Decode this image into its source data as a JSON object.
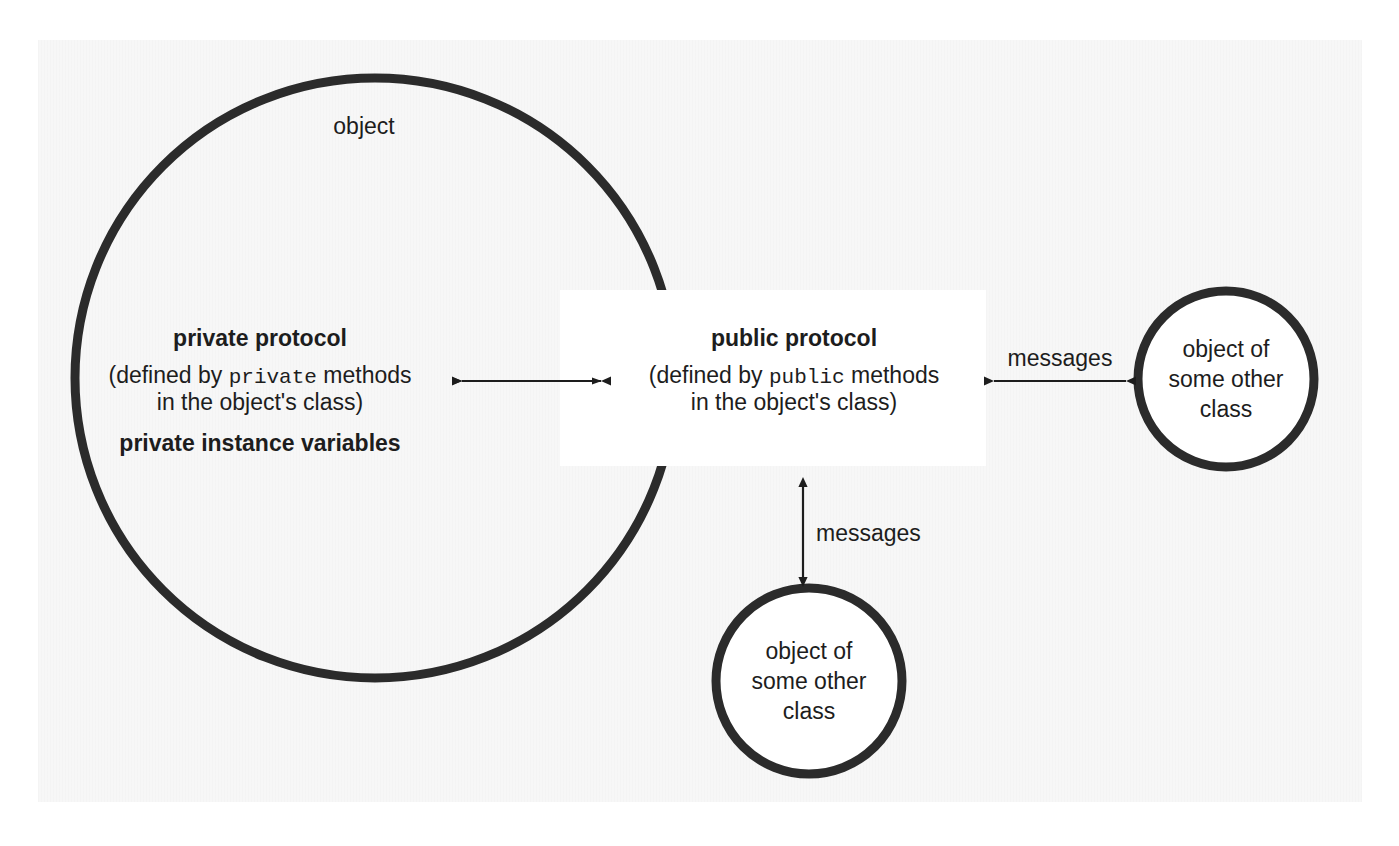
{
  "diagram": {
    "title_label": "object",
    "big_object": {
      "label": "object",
      "private": {
        "heading": "private protocol",
        "line1_prefix": "(defined by ",
        "line1_mono": "private",
        "line1_suffix": " methods",
        "line2": "in the object's class)",
        "instance_vars": "private instance variables"
      },
      "public": {
        "heading": "public protocol",
        "line1_prefix": "(defined by ",
        "line1_mono": "public",
        "line1_suffix": " methods",
        "line2": "in the object's class)"
      }
    },
    "other_objects": [
      {
        "line1": "object of",
        "line2": "some other",
        "line3": "class"
      },
      {
        "line1": "object of",
        "line2": "some other",
        "line3": "class"
      }
    ],
    "arrows": {
      "internal_label": "",
      "right_label": "messages",
      "bottom_label": "messages"
    },
    "colors": {
      "stroke": "#2b2b2b",
      "text": "#1d1d1d",
      "paper": "#f7f7f7",
      "band": "#ffffff"
    }
  }
}
